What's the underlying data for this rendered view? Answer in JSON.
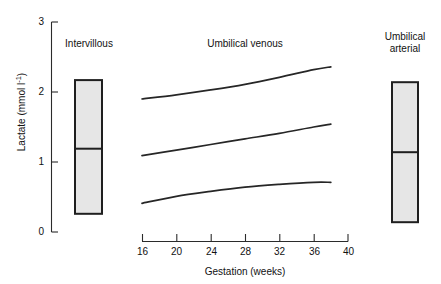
{
  "figure": {
    "background_color": "#ffffff",
    "line_color": "#262626",
    "box_fill_color": "#e6e6e6",
    "box_edge_color": "#1f1f1f"
  },
  "axes": {
    "ylabel_text": "Lactate (mmol l",
    "ylabel_exponent": "-1",
    "ylabel_close": ")",
    "ylabel_full": "Lactate (mmol l-1)",
    "xlabel": "Gestation (weeks)",
    "yticks": [
      "0",
      "1",
      "2",
      "3"
    ],
    "xticks": [
      "16",
      "20",
      "24",
      "28",
      "32",
      "36",
      "40"
    ]
  },
  "groups": {
    "intervillous_label": "Intervillous",
    "umbilical_venous_label": "Umbilical venous",
    "umbilical_arterial_label_line1": "Umbilical",
    "umbilical_arterial_label_line2": "arterial"
  },
  "chart_data": {
    "type": "line",
    "title": "",
    "xlabel": "Gestation (weeks)",
    "ylabel": "Lactate (mmol l-1)",
    "xlim": [
      16,
      40
    ],
    "ylim": [
      0,
      3
    ],
    "xticks": [
      16,
      20,
      24,
      28,
      32,
      36,
      40
    ],
    "yticks": [
      0,
      1,
      2,
      3
    ],
    "grid": false,
    "legend": "none (in-plot text labels)",
    "series": [
      {
        "name": "Umbilical venous 95th centile",
        "group": "Umbilical venous",
        "x": [
          16,
          20,
          24,
          28,
          32,
          36,
          38
        ],
        "values": [
          1.9,
          1.96,
          2.03,
          2.11,
          2.21,
          2.32,
          2.36
        ]
      },
      {
        "name": "Umbilical venous median",
        "group": "Umbilical venous",
        "x": [
          16,
          20,
          24,
          28,
          32,
          36,
          38
        ],
        "values": [
          1.09,
          1.17,
          1.25,
          1.33,
          1.41,
          1.5,
          1.54
        ]
      },
      {
        "name": "Umbilical venous 5th centile",
        "group": "Umbilical venous",
        "x": [
          16,
          20,
          24,
          28,
          32,
          36,
          38
        ],
        "values": [
          0.41,
          0.51,
          0.58,
          0.64,
          0.68,
          0.71,
          0.71
        ]
      }
    ],
    "boxes": [
      {
        "name": "Intervillous",
        "label": "Intervillous",
        "lower": 0.26,
        "median": 1.19,
        "upper": 2.17
      },
      {
        "name": "Umbilical arterial",
        "label": "Umbilical arterial",
        "lower": 0.14,
        "median": 1.14,
        "upper": 2.14
      }
    ]
  }
}
